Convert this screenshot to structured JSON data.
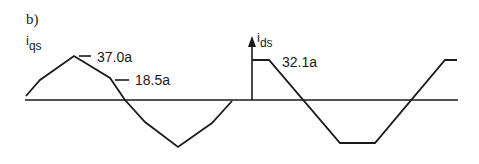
{
  "panel": {
    "label": "b)"
  },
  "signals": {
    "iqs": {
      "label_main": "i",
      "label_sub": "qs",
      "peak_label": "37.0a",
      "mid_label": "18.5a",
      "points": "26,96 40,80 74,56 110,78 125,100 145,122 178,147 212,123 232,101"
    },
    "ids": {
      "label_main": "i",
      "label_sub": "ds",
      "level_label": "32.1a",
      "points": "252,60 269,60 340,143 375,143 445,60 457,60"
    }
  },
  "axis": {
    "y": 100,
    "x_start": 25,
    "x_end": 458
  },
  "colors": {
    "stroke": "#1a1a1a",
    "background": "#ffffff"
  }
}
